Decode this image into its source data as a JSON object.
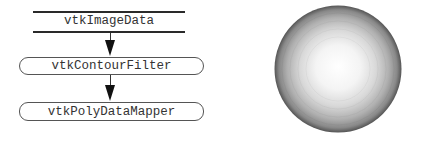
{
  "pipeline": {
    "source": {
      "label": "vtkImageData",
      "shape": "datastore"
    },
    "filter": {
      "label": "vtkContourFilter",
      "shape": "rounded-box"
    },
    "mapper": {
      "label": "vtkPolyDataMapper",
      "shape": "rounded-box"
    },
    "connections": [
      {
        "from": "vtkImageData",
        "to": "vtkContourFilter"
      },
      {
        "from": "vtkContourFilter",
        "to": "vtkPolyDataMapper"
      }
    ]
  },
  "render": {
    "object": "sphere",
    "shading": "flat-faceted grayscale",
    "colors": {
      "highlight": "#ffffff",
      "mid": "#c8c8c8",
      "edge": "#555555"
    }
  }
}
